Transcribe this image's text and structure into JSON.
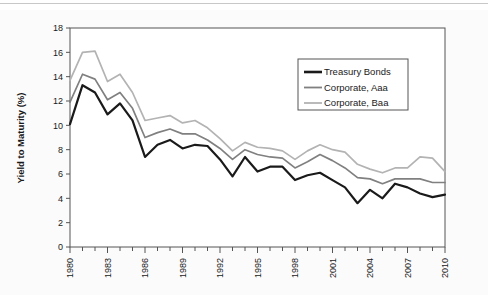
{
  "figure": {
    "background": "#fbfbfb",
    "frame_color": "#555555"
  },
  "chart_data": {
    "type": "line",
    "title": "",
    "xlabel": "",
    "ylabel": "Yield to Maturity (%)",
    "xlim": [
      1980,
      2010
    ],
    "ylim": [
      0,
      18
    ],
    "ytick_step": 2,
    "yticks": [
      0,
      2,
      4,
      6,
      8,
      10,
      12,
      14,
      16,
      18
    ],
    "ytick_labels": [
      "0",
      "2",
      "4",
      "6",
      "8",
      "10",
      "12",
      "14",
      "16",
      "18"
    ],
    "xticks": [
      1980,
      1981,
      1982,
      1983,
      1984,
      1985,
      1986,
      1987,
      1988,
      1989,
      1990,
      1991,
      1992,
      1993,
      1994,
      1995,
      1996,
      1997,
      1998,
      1999,
      2000,
      2001,
      2002,
      2003,
      2004,
      2005,
      2006,
      2007,
      2008,
      2009,
      2010
    ],
    "xtick_labels_shown": [
      "1980",
      "1983",
      "1986",
      "1989",
      "1992",
      "1995",
      "1998",
      "2001",
      "2004",
      "2007",
      "2010"
    ],
    "xtick_label_rotation": -90,
    "grid": false,
    "legend_position": "top-right",
    "x": [
      1980,
      1981,
      1982,
      1983,
      1984,
      1985,
      1986,
      1987,
      1988,
      1989,
      1990,
      1991,
      1992,
      1993,
      1994,
      1995,
      1996,
      1997,
      1998,
      1999,
      2000,
      2001,
      2002,
      2003,
      2004,
      2005,
      2006,
      2007,
      2008,
      2009,
      2010
    ],
    "series": [
      {
        "name": "Treasury Bonds",
        "color": "#1a1a1a",
        "width": 2.2,
        "values": [
          10.1,
          13.3,
          12.7,
          10.9,
          11.8,
          10.4,
          7.4,
          8.4,
          8.8,
          8.1,
          8.4,
          8.3,
          7.2,
          5.8,
          7.4,
          6.2,
          6.6,
          6.6,
          5.5,
          5.9,
          6.1,
          5.5,
          4.9,
          3.6,
          4.7,
          4.0,
          5.2,
          4.9,
          4.4,
          4.1,
          4.3
        ]
      },
      {
        "name": "Corporate, Aaa",
        "color": "#808080",
        "width": 1.7,
        "values": [
          11.9,
          14.2,
          13.8,
          12.1,
          12.7,
          11.4,
          9.0,
          9.4,
          9.7,
          9.3,
          9.3,
          8.8,
          8.1,
          7.2,
          8.0,
          7.6,
          7.4,
          7.3,
          6.5,
          7.0,
          7.6,
          7.1,
          6.5,
          5.7,
          5.6,
          5.2,
          5.6,
          5.6,
          5.6,
          5.3,
          5.3
        ]
      },
      {
        "name": "Corporate, Baa",
        "color": "#b3b3b3",
        "width": 1.7,
        "values": [
          13.7,
          16.0,
          16.1,
          13.6,
          14.2,
          12.7,
          10.4,
          10.6,
          10.8,
          10.2,
          10.4,
          9.8,
          8.9,
          7.9,
          8.6,
          8.2,
          8.1,
          7.9,
          7.2,
          7.9,
          8.4,
          8.0,
          7.8,
          6.8,
          6.4,
          6.1,
          6.5,
          6.5,
          7.4,
          7.3,
          6.2
        ]
      }
    ]
  },
  "legend": {
    "entries": [
      {
        "label": "Treasury Bonds",
        "color": "#1a1a1a",
        "width": 2.6
      },
      {
        "label": "Corporate, Aaa",
        "color": "#808080",
        "width": 1.8
      },
      {
        "label": "Corporate, Baa",
        "color": "#b3b3b3",
        "width": 1.8
      }
    ]
  }
}
